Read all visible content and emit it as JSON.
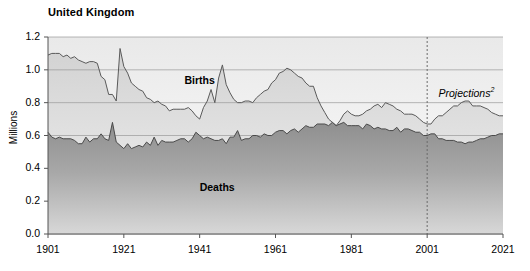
{
  "chart_data": {
    "type": "area",
    "title": "United Kingdom",
    "xlabel": "",
    "ylabel": "Millions",
    "xlim": [
      1901,
      2021
    ],
    "ylim": [
      0.0,
      1.2
    ],
    "grid": true,
    "legend": "inline-annotations",
    "y_ticks": [
      "0.0",
      "0.2",
      "0.4",
      "0.6",
      "0.8",
      "1.0",
      "1.2"
    ],
    "x_ticks": [
      "1901",
      "1921",
      "1941",
      "1961",
      "1981",
      "2001",
      "2021"
    ],
    "annotations": [
      {
        "text": "Births",
        "x": 1937,
        "y": 0.93
      },
      {
        "text": "Deaths",
        "x": 1941,
        "y": 0.28
      },
      {
        "text": "Projections",
        "superscript": "2",
        "x": 2004,
        "y": 0.86
      }
    ],
    "projection_start_year": 2001,
    "series": [
      {
        "name": "Births",
        "color": "#d7d7d7",
        "line_color": "#5a5a5a",
        "x": [
          1901,
          1902,
          1903,
          1904,
          1905,
          1906,
          1907,
          1908,
          1909,
          1910,
          1911,
          1912,
          1913,
          1914,
          1915,
          1916,
          1917,
          1918,
          1919,
          1920,
          1921,
          1922,
          1923,
          1924,
          1925,
          1926,
          1927,
          1928,
          1929,
          1930,
          1931,
          1932,
          1933,
          1934,
          1935,
          1936,
          1937,
          1938,
          1939,
          1940,
          1941,
          1942,
          1943,
          1944,
          1945,
          1946,
          1947,
          1948,
          1949,
          1950,
          1951,
          1952,
          1953,
          1954,
          1955,
          1956,
          1957,
          1958,
          1959,
          1960,
          1961,
          1962,
          1963,
          1964,
          1965,
          1966,
          1967,
          1968,
          1969,
          1970,
          1971,
          1972,
          1973,
          1974,
          1975,
          1976,
          1977,
          1978,
          1979,
          1980,
          1981,
          1982,
          1983,
          1984,
          1985,
          1986,
          1987,
          1988,
          1989,
          1990,
          1991,
          1992,
          1993,
          1994,
          1995,
          1996,
          1997,
          1998,
          1999,
          2000,
          2001,
          2002,
          2003,
          2004,
          2005,
          2006,
          2007,
          2008,
          2009,
          2010,
          2011,
          2012,
          2013,
          2014,
          2015,
          2016,
          2017,
          2018,
          2019,
          2020,
          2021
        ],
        "y": [
          1.09,
          1.1,
          1.1,
          1.1,
          1.08,
          1.09,
          1.07,
          1.08,
          1.06,
          1.05,
          1.04,
          1.05,
          1.05,
          1.04,
          0.96,
          0.94,
          0.85,
          0.85,
          0.81,
          1.13,
          1.02,
          0.98,
          0.92,
          0.9,
          0.88,
          0.87,
          0.83,
          0.82,
          0.8,
          0.81,
          0.79,
          0.78,
          0.75,
          0.76,
          0.76,
          0.76,
          0.76,
          0.77,
          0.75,
          0.72,
          0.7,
          0.77,
          0.81,
          0.88,
          0.8,
          0.95,
          1.03,
          0.91,
          0.86,
          0.82,
          0.8,
          0.8,
          0.81,
          0.81,
          0.8,
          0.83,
          0.85,
          0.87,
          0.88,
          0.92,
          0.94,
          0.98,
          0.99,
          1.01,
          1.0,
          0.98,
          0.96,
          0.95,
          0.92,
          0.9,
          0.9,
          0.83,
          0.78,
          0.74,
          0.7,
          0.68,
          0.66,
          0.69,
          0.73,
          0.75,
          0.73,
          0.72,
          0.72,
          0.73,
          0.75,
          0.76,
          0.78,
          0.79,
          0.77,
          0.8,
          0.79,
          0.78,
          0.76,
          0.75,
          0.73,
          0.73,
          0.73,
          0.72,
          0.7,
          0.68,
          0.67,
          0.67,
          0.7,
          0.72,
          0.72,
          0.74,
          0.76,
          0.78,
          0.78,
          0.8,
          0.81,
          0.81,
          0.78,
          0.78,
          0.78,
          0.77,
          0.76,
          0.74,
          0.73,
          0.72,
          0.72
        ]
      },
      {
        "name": "Deaths",
        "color": "#9b9b9b",
        "line_color": "#4a4a4a",
        "x": [
          1901,
          1902,
          1903,
          1904,
          1905,
          1906,
          1907,
          1908,
          1909,
          1910,
          1911,
          1912,
          1913,
          1914,
          1915,
          1916,
          1917,
          1918,
          1919,
          1920,
          1921,
          1922,
          1923,
          1924,
          1925,
          1926,
          1927,
          1928,
          1929,
          1930,
          1931,
          1932,
          1933,
          1934,
          1935,
          1936,
          1937,
          1938,
          1939,
          1940,
          1941,
          1942,
          1943,
          1944,
          1945,
          1946,
          1947,
          1948,
          1949,
          1950,
          1951,
          1952,
          1953,
          1954,
          1955,
          1956,
          1957,
          1958,
          1959,
          1960,
          1961,
          1962,
          1963,
          1964,
          1965,
          1966,
          1967,
          1968,
          1969,
          1970,
          1971,
          1972,
          1973,
          1974,
          1975,
          1976,
          1977,
          1978,
          1979,
          1980,
          1981,
          1982,
          1983,
          1984,
          1985,
          1986,
          1987,
          1988,
          1989,
          1990,
          1991,
          1992,
          1993,
          1994,
          1995,
          1996,
          1997,
          1998,
          1999,
          2000,
          2001,
          2002,
          2003,
          2004,
          2005,
          2006,
          2007,
          2008,
          2009,
          2010,
          2011,
          2012,
          2013,
          2014,
          2015,
          2016,
          2017,
          2018,
          2019,
          2020,
          2021
        ],
        "y": [
          0.62,
          0.59,
          0.58,
          0.59,
          0.58,
          0.58,
          0.58,
          0.57,
          0.55,
          0.55,
          0.59,
          0.56,
          0.58,
          0.58,
          0.61,
          0.58,
          0.57,
          0.68,
          0.56,
          0.54,
          0.52,
          0.55,
          0.52,
          0.53,
          0.54,
          0.53,
          0.56,
          0.54,
          0.59,
          0.54,
          0.57,
          0.56,
          0.56,
          0.56,
          0.57,
          0.58,
          0.58,
          0.56,
          0.58,
          0.62,
          0.6,
          0.58,
          0.59,
          0.58,
          0.57,
          0.57,
          0.58,
          0.55,
          0.59,
          0.59,
          0.63,
          0.57,
          0.58,
          0.58,
          0.6,
          0.6,
          0.59,
          0.61,
          0.6,
          0.6,
          0.62,
          0.63,
          0.63,
          0.61,
          0.63,
          0.64,
          0.62,
          0.64,
          0.66,
          0.65,
          0.65,
          0.67,
          0.67,
          0.67,
          0.66,
          0.68,
          0.66,
          0.67,
          0.68,
          0.66,
          0.66,
          0.66,
          0.66,
          0.64,
          0.67,
          0.66,
          0.64,
          0.65,
          0.64,
          0.64,
          0.63,
          0.63,
          0.65,
          0.62,
          0.64,
          0.64,
          0.63,
          0.62,
          0.62,
          0.6,
          0.6,
          0.61,
          0.61,
          0.58,
          0.58,
          0.57,
          0.57,
          0.57,
          0.56,
          0.56,
          0.55,
          0.56,
          0.56,
          0.57,
          0.58,
          0.58,
          0.59,
          0.6,
          0.6,
          0.61,
          0.61
        ]
      }
    ]
  }
}
